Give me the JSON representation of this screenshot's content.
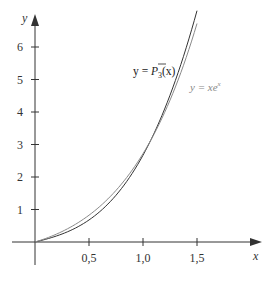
{
  "chart_data": {
    "type": "line",
    "title": "",
    "xlabel": "x",
    "ylabel": "y",
    "xlim": [
      0,
      1.6
    ],
    "ylim": [
      0,
      7
    ],
    "x_ticks": [
      "0,5",
      "1,0",
      "1,5"
    ],
    "x_tick_values": [
      0.5,
      1.0,
      1.5
    ],
    "y_ticks": [
      "1",
      "2",
      "3",
      "4",
      "5",
      "6"
    ],
    "y_tick_values": [
      1,
      2,
      3,
      4,
      5,
      6
    ],
    "grid": false,
    "series": [
      {
        "name": "y = P̄3(x)",
        "label_text": "y = P̄₃(x)",
        "color": "#333333",
        "x": [
          0,
          0.25,
          0.5,
          0.75,
          1.0,
          1.25,
          1.5
        ],
        "y": [
          0,
          0.29,
          0.77,
          1.55,
          2.67,
          4.25,
          6.7
        ]
      },
      {
        "name": "y = xe^x",
        "label_text": "y = xe^x",
        "color": "#888888",
        "x": [
          0,
          0.25,
          0.5,
          0.75,
          1.0,
          1.25,
          1.5
        ],
        "y": [
          0,
          0.32,
          0.82,
          1.59,
          2.72,
          4.36,
          6.72
        ]
      }
    ]
  },
  "labels": {
    "x_axis": "x",
    "y_axis": "y",
    "p3_label_prefix": "y = ",
    "p3_label_P": "P",
    "p3_label_sub": "3",
    "p3_label_arg": "(x)",
    "xex_label_prefix": "y = xe",
    "xex_label_sup": "x",
    "x_tick_labels": [
      "0,5",
      "1,0",
      "1,5"
    ],
    "y_tick_labels": [
      "1",
      "2",
      "3",
      "4",
      "5",
      "6"
    ]
  }
}
